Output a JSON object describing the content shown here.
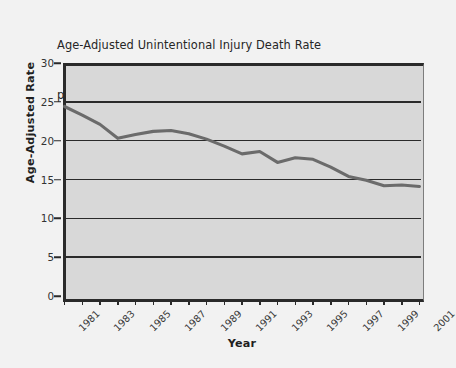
{
  "chart_data": {
    "type": "line",
    "title": "Age-Adjusted Unintentional Injury Death Rate per 100,000, United States, 0–4 years, 1981–2001",
    "title_lines": [
      "Age-Adjusted Unintentional Injury Death Rate",
      "per 100,000, United States, 0–4 years, 1981–2001"
    ],
    "xlabel": "Year",
    "ylabel": "Age-Adjusted Rate",
    "ylim": [
      0,
      30
    ],
    "xlim": [
      1981,
      2001
    ],
    "y_ticks": [
      0,
      5,
      10,
      15,
      20,
      25,
      30
    ],
    "y_tick_labels": [
      "0",
      "5",
      "10",
      "15",
      "20",
      "25",
      "30"
    ],
    "grid": "horizontal",
    "legend": "none",
    "line_color": "#6b6b6b",
    "plot_background": "#d8d8d8",
    "axis_color": "#2a2a2a",
    "x": [
      1981,
      1982,
      1983,
      1984,
      1985,
      1986,
      1987,
      1988,
      1989,
      1990,
      1991,
      1992,
      1993,
      1994,
      1995,
      1996,
      1997,
      1998,
      1999,
      2000,
      2001
    ],
    "x_tick_labels": [
      "1981",
      "",
      "1983",
      "",
      "1985",
      "",
      "1987",
      "",
      "1989",
      "",
      "1991",
      "",
      "1993",
      "",
      "1995",
      "",
      "1997",
      "",
      "1999",
      "",
      "2001"
    ],
    "x_tick_labels_shown": [
      "1981",
      "1983",
      "1985",
      "1987",
      "1989",
      "1991",
      "1993",
      "1995",
      "1997",
      "1999",
      "2001"
    ],
    "values": [
      24.4,
      23.3,
      22.1,
      20.3,
      20.8,
      21.2,
      21.3,
      20.9,
      20.2,
      19.3,
      18.3,
      18.6,
      17.2,
      17.8,
      17.6,
      16.6,
      15.4,
      14.9,
      14.2,
      14.3,
      14.1
    ],
    "series": [
      {
        "name": "Age-Adjusted Unintentional Injury Death Rate",
        "values": [
          24.4,
          23.3,
          22.1,
          20.3,
          20.8,
          21.2,
          21.3,
          20.9,
          20.2,
          19.3,
          18.3,
          18.6,
          17.2,
          17.8,
          17.6,
          16.6,
          15.4,
          14.9,
          14.2,
          14.3,
          14.1
        ]
      }
    ]
  }
}
